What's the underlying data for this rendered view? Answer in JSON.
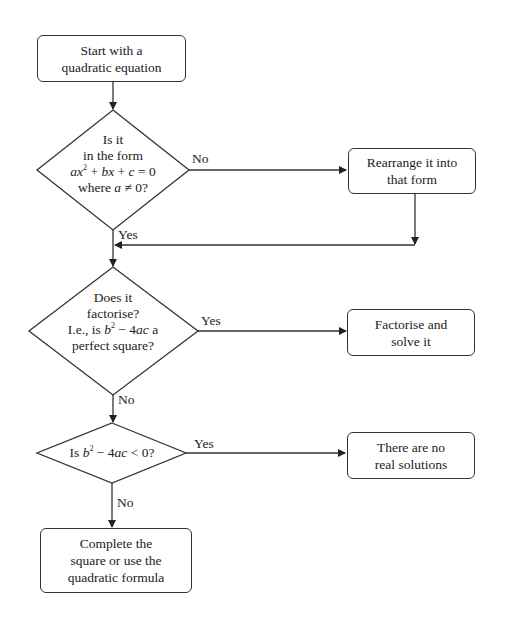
{
  "flowchart": {
    "start": {
      "line1": "Start with a",
      "line2": "quadratic equation"
    },
    "decision1": {
      "line1": "Is it",
      "line2": "in the form",
      "equation": "ax² + bx + c = 0",
      "line4": "where a ≠ 0?",
      "no_label": "No",
      "yes_label": "Yes"
    },
    "rearrange": {
      "line1": "Rearrange it into",
      "line2": "that form"
    },
    "decision2": {
      "line1": "Does it",
      "line2": "factorise?",
      "line3": "I.e., is b² − 4ac a",
      "line4": "perfect square?",
      "yes_label": "Yes",
      "no_label": "No"
    },
    "factorise": {
      "line1": "Factorise and",
      "line2": "solve it"
    },
    "decision3": {
      "text": "Is b² − 4ac < 0?",
      "yes_label": "Yes",
      "no_label": "No"
    },
    "no_solutions": {
      "line1": "There are no",
      "line2": "real solutions"
    },
    "final": {
      "line1": "Complete the",
      "line2": "square or use the",
      "line3": "quadratic formula"
    }
  }
}
